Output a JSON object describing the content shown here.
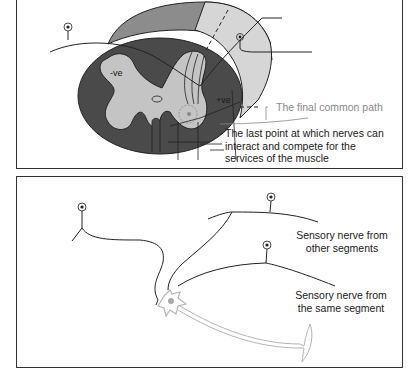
{
  "top_panel": {
    "labels": {
      "negative": "-ve",
      "positive": "+ve",
      "final_common_path": "The final common path",
      "last_point": [
        "The last point at which nerves can",
        "interact and compete for the",
        "services of the muscle"
      ]
    }
  },
  "bottom_panel": {
    "labels": {
      "other_segments": [
        "Sensory nerve from",
        "other segments"
      ],
      "same_segment": [
        "Sensory nerve from",
        "the same segment"
      ]
    }
  },
  "colors": {
    "white_matter": "#4a4a4a",
    "grey_matter": "#c4c4c4",
    "cylinder_top": "#8c8c8c",
    "cylinder_right": "#d6d6d6",
    "line": "#222222",
    "motor_axon": "#b5b5b5",
    "label_gray": "#8a8a8a"
  }
}
